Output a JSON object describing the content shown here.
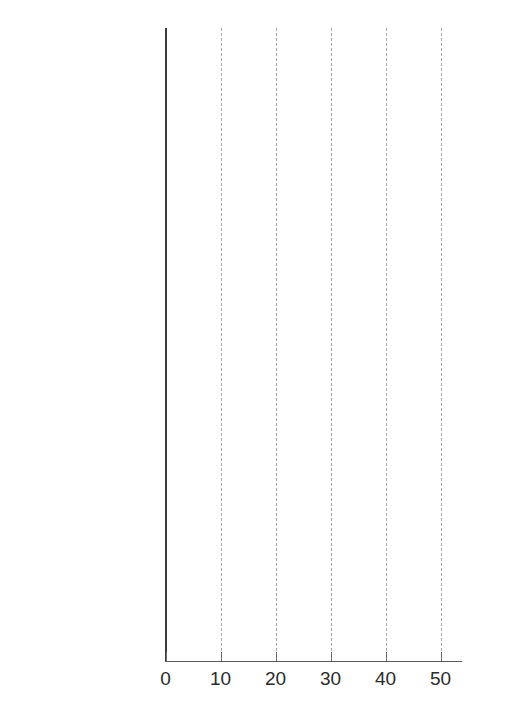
{
  "chart_data": {
    "type": "bar",
    "orientation": "horizontal",
    "title": "",
    "subtitle": "",
    "xlabel": "",
    "ylabel": "",
    "xlim": [
      0,
      55
    ],
    "xticks": [
      0,
      10,
      20,
      30,
      40,
      50
    ],
    "xtick_labels": [
      "0",
      "10",
      "20",
      "30",
      "40",
      "50"
    ],
    "grid": "vertical-dashed",
    "legend": "inline-labels",
    "value_suffix": "%",
    "series": [
      {
        "name": "Men",
        "color": "#9a9a9a"
      },
      {
        "name": "Women",
        "color": "#7b7b7b"
      }
    ],
    "groups": [
      {
        "label": "College graduate",
        "periods": [
          {
            "label": "1988–1994",
            "values": [
              15.6,
              15.3
            ]
          },
          {
            "label": "2005–2008",
            "values": [
              27.4,
              23.4
            ]
          }
        ]
      },
      {
        "label": "High school",
        "periods": [
          {
            "label": "1988–1994",
            "values": [
              21.8,
              28.2
            ]
          },
          {
            "label": "2005–2008",
            "values": [
              34.8,
              39.8
            ]
          }
        ]
      },
      {
        "label": "Less than high school",
        "periods": [
          {
            "label": "1988–1994",
            "values": [
              22.6,
              31.7
            ]
          },
          {
            "label": "2005–2008",
            "values": [
              32.1,
              42.1
            ]
          }
        ]
      }
    ],
    "bars": [
      {
        "group": "College graduate",
        "period": "1988–1994",
        "series": "Men",
        "value": 15.6,
        "label": "Men 15.6%",
        "label_placement": "outside"
      },
      {
        "group": "College graduate",
        "period": "1988–1994",
        "series": "Women",
        "value": 15.3,
        "label": "Women 15.3%",
        "label_placement": "outside"
      },
      {
        "group": "College graduate",
        "period": "2005–2008",
        "series": "Men",
        "value": 27.4,
        "label": "Men 27.4%",
        "label_placement": "inside"
      },
      {
        "group": "College graduate",
        "period": "2005–2008",
        "series": "Women",
        "value": 23.4,
        "label": "Women 23.4%",
        "label_placement": "inside"
      },
      {
        "group": "High school",
        "period": "1988–1994",
        "series": "Men",
        "value": 21.8,
        "label": "Men 21.8%",
        "label_placement": "inside"
      },
      {
        "group": "High school",
        "period": "1988–1994",
        "series": "Women",
        "value": 28.2,
        "label": "Women 28.2%",
        "label_placement": "inside"
      },
      {
        "group": "High school",
        "period": "2005–2008",
        "series": "Men",
        "value": 34.8,
        "label": "Men 34.8%",
        "label_placement": "inside"
      },
      {
        "group": "High school",
        "period": "2005–2008",
        "series": "Women",
        "value": 39.8,
        "label": "Women 39.8%",
        "label_placement": "inside"
      },
      {
        "group": "Less than high school",
        "period": "1988–1994",
        "series": "Men",
        "value": 22.6,
        "label": "Men 22.6%",
        "label_placement": "inside"
      },
      {
        "group": "Less than high school",
        "period": "1988–1994",
        "series": "Women",
        "value": 31.7,
        "label": "Women 31.7%",
        "label_placement": "inside"
      },
      {
        "group": "Less than high school",
        "period": "2005–2008",
        "series": "Men",
        "value": 32.1,
        "label": "Men 32.1%",
        "label_placement": "inside"
      },
      {
        "group": "Less than high school",
        "period": "2005–2008",
        "series": "Women",
        "value": 42.1,
        "label": "Women 42.1%",
        "label_placement": "inside"
      }
    ]
  },
  "axis": {
    "x_origin_label": "0",
    "tick_labels": [
      "0",
      "10",
      "20",
      "30",
      "40",
      "50"
    ]
  },
  "group_labels": [
    "College graduate",
    "High school",
    "Less than high school"
  ],
  "period_labels": [
    "1988–1994",
    "2005–2008",
    "1988–1994",
    "2005–2008",
    "1988–1994",
    "2005–2008"
  ],
  "bar_labels": [
    "Men 15.6%",
    "Women 15.3%",
    "Men 27.4%",
    "Women 23.4%",
    "Men 21.8%",
    "Women 28.2%",
    "Men 34.8%",
    "Women 39.8%",
    "Men 22.6%",
    "Women 31.7%",
    "Men 32.1%",
    "Women 42.1%"
  ],
  "colors": {
    "men_face": "#9e9e9e",
    "men_top": "#b9b9b9",
    "men_side": "#8a8a8a",
    "women_face": "#808080",
    "women_top": "#9b9b9b",
    "women_side": "#6d6d6d",
    "axis": "#3c3c3c",
    "grid": "#a9a9a9",
    "text": "#231f20",
    "value_inside": "#ffffff"
  }
}
